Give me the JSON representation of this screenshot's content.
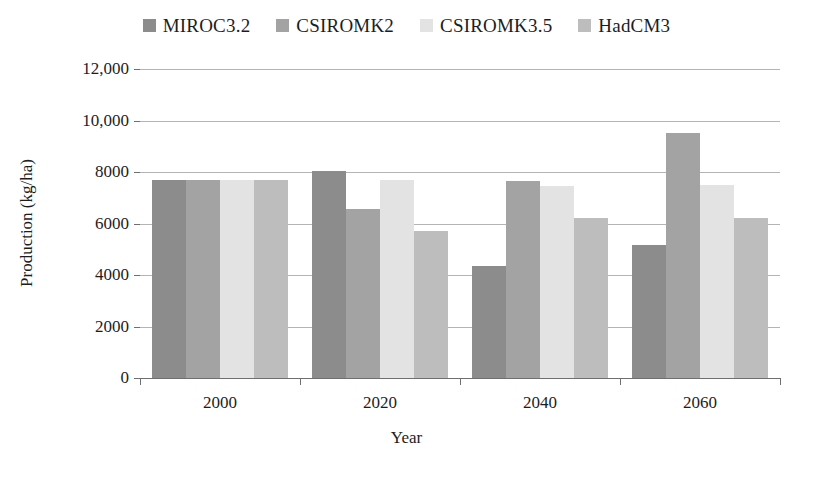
{
  "chart_data": {
    "type": "bar",
    "title": "",
    "subtitle": "",
    "xlabel": "Year",
    "ylabel": "Production (kg/ha)",
    "categories": [
      "2000",
      "2020",
      "2040",
      "2060"
    ],
    "ylim": [
      0,
      12000
    ],
    "ytick_values": [
      0,
      2000,
      4000,
      6000,
      8000,
      10000,
      12000
    ],
    "ytick_labels": [
      "0",
      "2000",
      "4000",
      "6000",
      "8000",
      "10,000",
      "12,000"
    ],
    "grid": true,
    "legend_position": "top-center",
    "series": [
      {
        "name": "MIROC3.2",
        "color": "#8c8c8c",
        "values": [
          7700,
          8050,
          4350,
          5150
        ]
      },
      {
        "name": "CSIROMK2",
        "color": "#a3a3a3",
        "values": [
          7700,
          6550,
          7650,
          9500
        ]
      },
      {
        "name": "CSIROMK3.5",
        "color": "#e3e3e3",
        "values": [
          7700,
          7700,
          7450,
          7500
        ]
      },
      {
        "name": "HadCM3",
        "color": "#bdbdbd",
        "values": [
          7700,
          5700,
          6200,
          6200
        ]
      }
    ]
  }
}
